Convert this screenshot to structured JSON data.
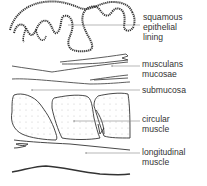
{
  "diagram": {
    "type": "histology-cross-section",
    "layers": [
      {
        "id": "epithelium",
        "label": "squamous\nepithelial\nlining"
      },
      {
        "id": "muscularis-mucosae",
        "label": "musculans\nmucosae"
      },
      {
        "id": "submucosa",
        "label": "submucosa"
      },
      {
        "id": "circular-muscle",
        "label": "circular\nmuscle"
      },
      {
        "id": "longitudinal-muscle",
        "label": "longitudinal\nmuscle"
      }
    ]
  },
  "colors": {
    "line": "#333333",
    "leader": "#888888",
    "text": "#333333",
    "dots": "#bbbbbb"
  }
}
